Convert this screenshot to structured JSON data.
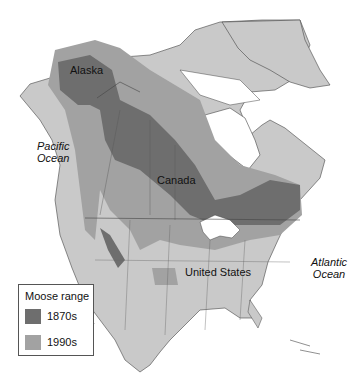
{
  "map": {
    "title": "Moose range",
    "labels": {
      "alaska": "Alaska",
      "canada": "Canada",
      "united_states": "United States",
      "pacific": [
        "Pacific",
        "Ocean"
      ],
      "atlantic": [
        "Atlantic",
        "Ocean"
      ]
    },
    "colors": {
      "land": "#c9c9c9",
      "range_1990s": "#a2a2a2",
      "range_1870s": "#6e6e6e",
      "water": "#ffffff",
      "border": "#444444"
    },
    "legend": {
      "title": "Moose range",
      "items": [
        {
          "label": "1870s",
          "color": "#6e6e6e"
        },
        {
          "label": "1990s",
          "color": "#a2a2a2"
        }
      ]
    },
    "icons": [
      "moose-outline-icon"
    ]
  }
}
